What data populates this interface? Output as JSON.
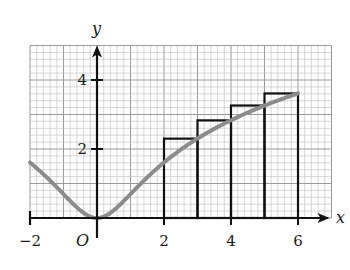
{
  "chart_data": {
    "type": "line",
    "title": "",
    "function": "y = ln(1 + x^2)",
    "xlabel": "x",
    "ylabel": "y",
    "origin_label": "O",
    "xlim": [
      -2,
      7
    ],
    "ylim": [
      0,
      5
    ],
    "grid": true,
    "grid_minor_step": 0.2,
    "grid_major_step": 1,
    "x_ticks": [
      -2,
      2,
      4,
      6
    ],
    "x_tick_labels": [
      "−2",
      "2",
      "4",
      "6"
    ],
    "y_ticks": [
      2,
      4
    ],
    "y_tick_labels": [
      "2",
      "4"
    ],
    "series": [
      {
        "name": "curve",
        "color": "#8c8c8c",
        "x": [
          -2,
          -1.5,
          -1,
          -0.5,
          0,
          0.5,
          1,
          1.5,
          2,
          3,
          4,
          5,
          6
        ],
        "y": [
          1.61,
          1.18,
          0.69,
          0.22,
          0,
          0.22,
          0.69,
          1.18,
          1.61,
          2.3,
          2.83,
          3.26,
          3.61
        ]
      }
    ],
    "rectangles": [
      {
        "x0": 2,
        "x1": 3,
        "height": 2.3
      },
      {
        "x0": 3,
        "x1": 4,
        "height": 2.83
      },
      {
        "x0": 4,
        "x1": 5,
        "height": 3.26
      },
      {
        "x0": 5,
        "x1": 6,
        "height": 3.61
      }
    ],
    "colors": {
      "grid_minor": "#bdbdbd",
      "grid_major": "#9a9a9a",
      "axes": "#111111",
      "rectangles": "#111111",
      "curve": "#8c8c8c"
    }
  }
}
